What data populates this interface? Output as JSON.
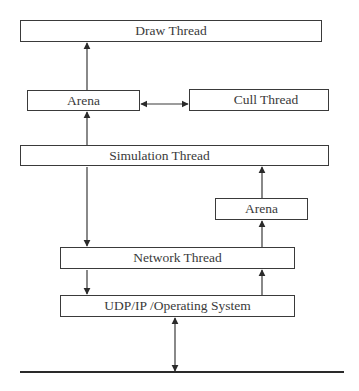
{
  "diagram": {
    "type": "thread-architecture",
    "nodes": [
      {
        "id": "draw",
        "label": "Draw Thread"
      },
      {
        "id": "arena_left",
        "label": "Arena"
      },
      {
        "id": "cull",
        "label": "Cull Thread"
      },
      {
        "id": "simulation",
        "label": "Simulation Thread"
      },
      {
        "id": "arena_right",
        "label": "Arena"
      },
      {
        "id": "network",
        "label": "Network Thread"
      },
      {
        "id": "udp",
        "label": "UDP/IP /Operating System"
      }
    ],
    "edges": [
      {
        "from": "arena_left",
        "to": "draw",
        "direction": "one-way"
      },
      {
        "from": "arena_left",
        "to": "cull",
        "direction": "bidirectional"
      },
      {
        "from": "simulation",
        "to": "arena_left",
        "direction": "one-way"
      },
      {
        "from": "simulation",
        "to": "network",
        "direction": "one-way"
      },
      {
        "from": "arena_right",
        "to": "simulation",
        "direction": "one-way"
      },
      {
        "from": "network",
        "to": "arena_right",
        "direction": "one-way"
      },
      {
        "from": "network",
        "to": "udp",
        "direction": "one-way"
      },
      {
        "from": "udp",
        "to": "network",
        "direction": "one-way"
      },
      {
        "from": "udp",
        "to": "network_bus",
        "direction": "bidirectional"
      }
    ],
    "colors": {
      "stroke": "#3a3a3a",
      "background": "#ffffff"
    }
  }
}
